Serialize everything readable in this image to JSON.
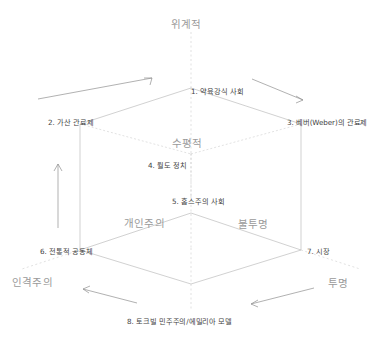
{
  "diagram": {
    "type": "isometric-cube-typology",
    "vertices": [
      {
        "id": 1,
        "label": "1. 약육강식 사회",
        "x": 191,
        "y": 88,
        "anchor": "left"
      },
      {
        "id": 2,
        "label": "2. 가산 관료제",
        "x": 48,
        "y": 119,
        "anchor": "left"
      },
      {
        "id": 3,
        "label": "3. 베버(Weber)의 관료제",
        "x": 287,
        "y": 119,
        "anchor": "left"
      },
      {
        "id": 4,
        "label": "4. 월도 정치",
        "x": 148,
        "y": 162,
        "anchor": "left"
      },
      {
        "id": 5,
        "label": "5. 홉스주의 사회",
        "x": 172,
        "y": 198,
        "anchor": "left"
      },
      {
        "id": 6,
        "label": "6. 전통적 공동체",
        "x": 40,
        "y": 248,
        "anchor": "left"
      },
      {
        "id": 7,
        "label": "7. 시장",
        "x": 307,
        "y": 248,
        "anchor": "left"
      },
      {
        "id": 8,
        "label": "8. 토크빌 민주주의/에밀리아 모델",
        "x": 127,
        "y": 318,
        "anchor": "left"
      }
    ],
    "axis_labels": [
      {
        "name": "top-axis",
        "label": "위계적",
        "x": 171,
        "y": 19
      },
      {
        "name": "mid-axis",
        "label": "수평적",
        "x": 172,
        "y": 138
      },
      {
        "name": "left-inner",
        "label": "개인주의",
        "x": 124,
        "y": 218
      },
      {
        "name": "right-inner",
        "label": "불투명",
        "x": 238,
        "y": 219
      },
      {
        "name": "left-outer",
        "label": "인격주의",
        "x": 12,
        "y": 277
      },
      {
        "name": "right-outer",
        "label": "투명",
        "x": 328,
        "y": 278
      }
    ],
    "arrows": [
      {
        "name": "arrow-top-left",
        "direction": "up-right",
        "from": [
          38,
          98
        ],
        "to": [
          150,
          78
        ]
      },
      {
        "name": "arrow-top-right",
        "direction": "down-right",
        "from": [
          253,
          78
        ],
        "to": [
          300,
          100
        ]
      },
      {
        "name": "arrow-left-side",
        "direction": "up",
        "from": [
          58,
          226
        ],
        "to": [
          58,
          164
        ]
      },
      {
        "name": "arrow-bottom-left",
        "direction": "left",
        "from": [
          136,
          302
        ],
        "to": [
          82,
          288
        ]
      },
      {
        "name": "arrow-bottom-right",
        "direction": "left-down",
        "from": [
          313,
          288
        ],
        "to": [
          250,
          303
        ]
      }
    ],
    "colors": {
      "background": "#ffffff",
      "edge": "#bdbdbd",
      "axis": "#d4d4d4",
      "arrow": "#8f8f8f",
      "vertex_text": "#3f3f3f",
      "axis_text": "#9a9a9a"
    }
  }
}
